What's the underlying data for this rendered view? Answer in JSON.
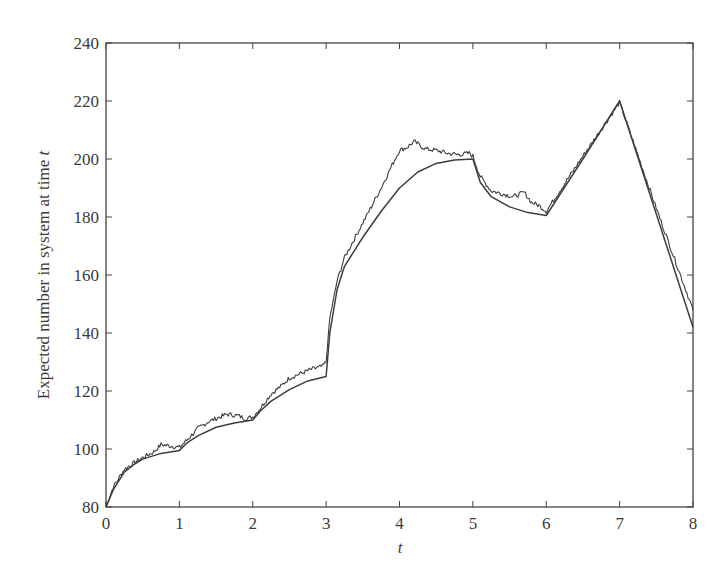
{
  "chart_data": {
    "type": "line",
    "title": "",
    "xlabel": "t",
    "ylabel": "Expected number in system at time t",
    "xlim": [
      0,
      8
    ],
    "ylim": [
      80,
      240
    ],
    "grid": false,
    "legend": null,
    "x_ticks": [
      "0",
      "1",
      "2",
      "3",
      "4",
      "5",
      "6",
      "7",
      "8"
    ],
    "y_ticks": [
      "80",
      "100",
      "120",
      "140",
      "160",
      "180",
      "200",
      "220",
      "240"
    ],
    "series": [
      {
        "name": "fluid approximation (smooth)",
        "x": [
          0,
          0.1,
          0.25,
          0.4,
          0.5,
          0.75,
          1.0,
          1.1,
          1.25,
          1.5,
          1.75,
          2.0,
          2.1,
          2.25,
          2.5,
          2.75,
          3.0,
          3.05,
          3.15,
          3.25,
          3.5,
          3.75,
          4.0,
          4.25,
          4.5,
          4.75,
          5.0,
          5.1,
          5.25,
          5.5,
          5.75,
          6.0,
          6.5,
          7.0,
          7.5,
          8.0
        ],
        "values": [
          80,
          86,
          92,
          95,
          96.5,
          98.5,
          99.5,
          102,
          104.5,
          107.5,
          109,
          110,
          113,
          116.5,
          120.5,
          123.5,
          125,
          140,
          155,
          163,
          173,
          182,
          190,
          195.5,
          198.5,
          199.7,
          200,
          192,
          187,
          183.5,
          181.5,
          180.5,
          200,
          220,
          181,
          142
        ]
      },
      {
        "name": "simulation (noisy)",
        "x": [
          0,
          0.1,
          0.25,
          0.4,
          0.5,
          0.65,
          0.75,
          0.9,
          1.0,
          1.1,
          1.25,
          1.4,
          1.5,
          1.65,
          1.8,
          1.9,
          2.0,
          2.1,
          2.25,
          2.4,
          2.5,
          2.65,
          2.8,
          2.95,
          3.0,
          3.05,
          3.15,
          3.25,
          3.5,
          3.75,
          3.9,
          4.0,
          4.1,
          4.2,
          4.35,
          4.5,
          4.65,
          4.8,
          4.95,
          5.0,
          5.1,
          5.25,
          5.4,
          5.55,
          5.7,
          5.8,
          5.9,
          6.0,
          6.5,
          7.0,
          7.5,
          8.0
        ],
        "values": [
          80,
          87,
          93,
          95.5,
          97,
          99,
          101.5,
          101,
          100.5,
          103,
          107,
          109.5,
          110.5,
          112,
          111.5,
          110.5,
          111,
          114,
          119,
          122,
          124.5,
          126,
          127.5,
          128.5,
          130,
          145,
          158,
          166,
          178,
          190,
          198,
          203,
          204,
          206,
          203.5,
          203,
          202,
          201.5,
          202,
          201,
          194,
          189,
          188,
          187,
          188.5,
          185,
          184,
          182,
          201,
          219.5,
          183,
          148
        ]
      }
    ]
  }
}
